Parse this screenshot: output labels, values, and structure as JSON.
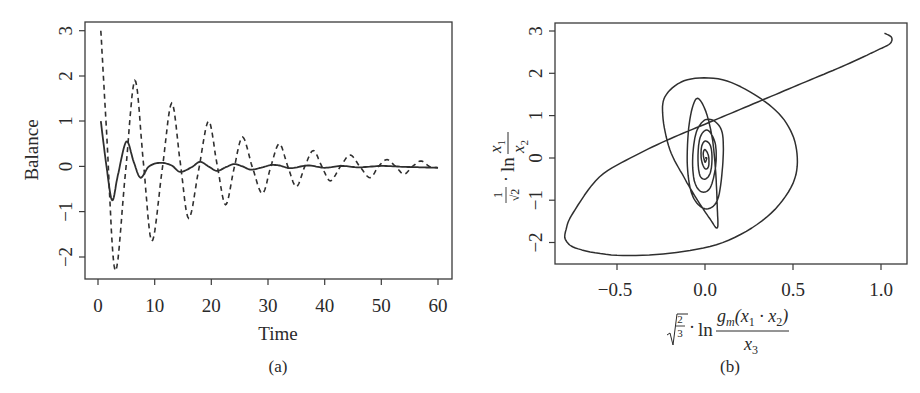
{
  "chart_data": [
    {
      "panel": "a",
      "type": "line",
      "caption": "(a)",
      "title": "",
      "xlabel": "Time",
      "ylabel": "Balance",
      "xlim": [
        0,
        60
      ],
      "ylim": [
        -2.5,
        3.2
      ],
      "xticks": [
        0,
        10,
        20,
        30,
        40,
        50,
        60
      ],
      "yticks": [
        -2,
        -1,
        0,
        1,
        2,
        3
      ],
      "grid": false,
      "legend": null,
      "series": [
        {
          "name": "solid",
          "style": "solid",
          "x": [
            0.5,
            1.5,
            2.5,
            3.5,
            5.0,
            6.3,
            7.5,
            9.0,
            11.0,
            13.0,
            14.5,
            16.5,
            18.0,
            19.5,
            21.0,
            22.5,
            24.0,
            25.5,
            27.0,
            29.0,
            30.5,
            32.0,
            34.0,
            37.0,
            40.0,
            43.0,
            46.0,
            50.0,
            54.0,
            57.0,
            60.0
          ],
          "y": [
            1.0,
            0.0,
            -0.75,
            -0.2,
            0.55,
            0.1,
            -0.25,
            0.0,
            0.08,
            0.02,
            -0.12,
            -0.02,
            0.1,
            0.0,
            -0.1,
            -0.02,
            0.05,
            0.0,
            -0.07,
            -0.02,
            0.03,
            0.02,
            -0.04,
            0.02,
            -0.03,
            0.01,
            -0.02,
            0.01,
            -0.01,
            -0.02,
            -0.03
          ]
        },
        {
          "name": "dashed",
          "style": "dashed",
          "x": [
            0.5,
            1.5,
            3.0,
            4.8,
            6.5,
            8.0,
            9.5,
            11.3,
            13.0,
            14.5,
            16.0,
            17.8,
            19.5,
            21.0,
            22.5,
            24.0,
            25.5,
            27.2,
            29.0,
            30.5,
            32.0,
            33.5,
            35.0,
            36.5,
            38.0,
            39.5,
            41.0,
            42.8,
            44.5,
            46.2,
            48.0,
            49.5,
            51.0,
            52.5,
            54.0,
            55.5,
            57.0,
            58.5,
            60.0
          ],
          "y": [
            3.0,
            0.8,
            -2.3,
            -0.2,
            1.9,
            0.1,
            -1.65,
            -0.1,
            1.4,
            0.1,
            -1.15,
            -0.05,
            1.0,
            0.05,
            -0.85,
            -0.05,
            0.65,
            0.0,
            -0.6,
            0.0,
            0.5,
            0.0,
            -0.45,
            0.0,
            0.35,
            0.0,
            -0.32,
            0.0,
            0.25,
            0.0,
            -0.25,
            0.0,
            0.15,
            0.0,
            -0.17,
            0.0,
            0.12,
            0.0,
            -0.03
          ]
        }
      ]
    },
    {
      "panel": "b",
      "type": "line",
      "caption": "(b)",
      "title": "",
      "xlabel": "√(2/3) · ln( g_m(x1 · x2) / x3 )",
      "ylabel": "(1/√2) · ln( x1 / x2 )",
      "xlim": [
        -0.85,
        1.12
      ],
      "ylim": [
        -2.5,
        3.2
      ],
      "xticks": [
        -0.5,
        0.0,
        0.5,
        1.0
      ],
      "yticks": [
        -2,
        -1,
        0,
        1,
        2,
        3
      ],
      "grid": false,
      "legend": null,
      "series": [
        {
          "name": "trajectory",
          "style": "solid",
          "x": [
            1.02,
            1.06,
            1.05,
            0.98,
            0.8,
            0.6,
            0.4,
            0.2,
            0.0,
            -0.2,
            -0.4,
            -0.6,
            -0.75,
            -0.79,
            -0.79,
            -0.72,
            -0.5,
            -0.2,
            0.1,
            0.35,
            0.5,
            0.52,
            0.45,
            0.3,
            0.1,
            -0.1,
            -0.22,
            -0.24,
            -0.2,
            -0.12,
            -0.05,
            0.03,
            0.07,
            0.07,
            0.06,
            0.04,
            0.0,
            -0.05,
            -0.09,
            -0.1,
            -0.07,
            0.0,
            0.07,
            0.1,
            0.1,
            0.06,
            0.0,
            -0.05,
            -0.07,
            -0.06,
            -0.02,
            0.03,
            0.06,
            0.06,
            0.03,
            0.0,
            -0.03,
            -0.04,
            -0.03,
            0.0,
            0.03,
            0.04,
            0.03,
            0.0,
            -0.02,
            -0.02,
            0.0,
            0.02,
            0.02,
            0.0,
            -0.01,
            0.0,
            0.01,
            0.0
          ],
          "y": [
            2.95,
            2.85,
            2.7,
            2.55,
            2.2,
            1.85,
            1.5,
            1.15,
            0.8,
            0.45,
            0.05,
            -0.45,
            -1.3,
            -1.7,
            -1.95,
            -2.15,
            -2.3,
            -2.25,
            -2.0,
            -1.4,
            -0.6,
            0.2,
            0.9,
            1.45,
            1.85,
            1.85,
            1.5,
            1.0,
            0.2,
            -0.45,
            -0.95,
            -1.45,
            -1.65,
            -1.2,
            -0.3,
            0.5,
            1.15,
            1.4,
            0.8,
            -0.2,
            -0.9,
            -1.2,
            -1.0,
            -0.2,
            0.55,
            0.85,
            0.9,
            0.6,
            0.0,
            -0.55,
            -0.8,
            -0.7,
            -0.2,
            0.3,
            0.6,
            0.65,
            0.45,
            0.0,
            -0.4,
            -0.5,
            -0.35,
            0.0,
            0.3,
            0.4,
            0.25,
            -0.05,
            -0.25,
            -0.2,
            0.05,
            0.2,
            0.1,
            -0.1,
            0.0,
            0.0
          ]
        }
      ]
    }
  ],
  "panel_a": {
    "caption": "(a)",
    "xlabel": "Time",
    "ylabel": "Balance",
    "xtick_labels": [
      "0",
      "10",
      "20",
      "30",
      "40",
      "50",
      "60"
    ],
    "ytick_labels": [
      "−2",
      "−1",
      "0",
      "1",
      "2",
      "3"
    ]
  },
  "panel_b": {
    "caption": "(b)",
    "xtick_labels": [
      "−0.5",
      "0.0",
      "0.5",
      "1.0"
    ],
    "ytick_labels": [
      "−2",
      "−1",
      "0",
      "1",
      "2",
      "3"
    ],
    "xlabel": {
      "sqrt_num": "2",
      "sqrt_den": "3",
      "dot": "·",
      "ln": "ln",
      "numerator": "g",
      "numerator_sub": "m",
      "numerator_rest_open": "(x",
      "numerator_sub1": "1",
      "numerator_dot": " · x",
      "numerator_sub2": "2",
      "numerator_close": ")",
      "denominator": "x",
      "denominator_sub": "3"
    },
    "ylabel": {
      "frac_num": "1",
      "frac_den": "√2",
      "dot": "·",
      "ln": "ln",
      "numerator": "x",
      "numerator_sub": "1",
      "denominator": "x",
      "denominator_sub": "2"
    }
  },
  "colors": {
    "line": "#2f2f2f",
    "axis": "#3a3a3a",
    "background": "#ffffff"
  }
}
